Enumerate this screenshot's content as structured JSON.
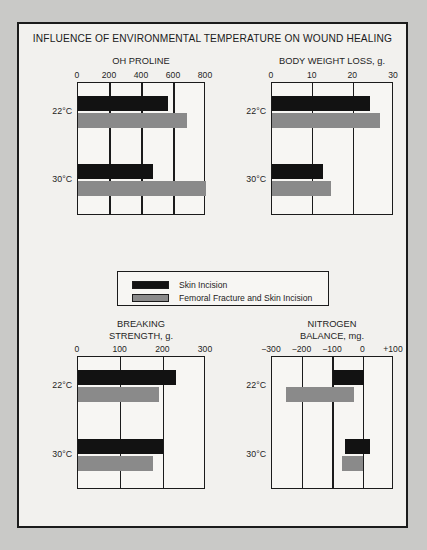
{
  "figure": {
    "title": "INFLUENCE OF ENVIRONMENTAL TEMPERATURE ON WOUND HEALING",
    "background_color": "#f2f1ee",
    "border_color": "#1b1b1b",
    "page_background": "#c9c9c7"
  },
  "legend": {
    "entries": [
      {
        "label": "Skin Incision",
        "color": "#121212",
        "key": "skin-incision"
      },
      {
        "label": "Femoral Fracture and Skin Incision",
        "color": "#8a8a8a",
        "key": "femoral-fracture-and-skin-incision"
      }
    ]
  },
  "chart_data": [
    {
      "id": "oh-proline",
      "type": "bar",
      "orientation": "horizontal",
      "title": "OH PROLINE",
      "title_lines": [
        "OH PROLINE"
      ],
      "xlabel": "",
      "ylabel": "",
      "categories": [
        "22°C",
        "30°C"
      ],
      "xlim": [
        0,
        800
      ],
      "ticks": [
        0,
        200,
        400,
        600,
        800
      ],
      "tick_labels": [
        "0",
        "200",
        "400",
        "600",
        "800"
      ],
      "grid": true,
      "series": [
        {
          "name": "Skin Incision",
          "color": "#121212",
          "values": [
            560,
            470
          ]
        },
        {
          "name": "Femoral Fracture and Skin Incision",
          "color": "#8a8a8a",
          "values": [
            680,
            800
          ]
        }
      ]
    },
    {
      "id": "body-weight-loss",
      "type": "bar",
      "orientation": "horizontal",
      "title": "BODY WEIGHT LOSS, g.",
      "title_lines": [
        "BODY WEIGHT LOSS, g."
      ],
      "xlabel": "",
      "ylabel": "",
      "categories": [
        "22°C",
        "30°C"
      ],
      "xlim": [
        0,
        30
      ],
      "ticks": [
        0,
        10,
        20,
        30
      ],
      "tick_labels": [
        "0",
        "10",
        "20",
        "30"
      ],
      "grid": true,
      "series": [
        {
          "name": "Skin Incision",
          "color": "#121212",
          "values": [
            24,
            12.5
          ]
        },
        {
          "name": "Femoral Fracture and Skin Incision",
          "color": "#8a8a8a",
          "values": [
            26.5,
            14.5
          ]
        }
      ]
    },
    {
      "id": "breaking-strength",
      "type": "bar",
      "orientation": "horizontal",
      "title": "BREAKING STRENGTH, g.",
      "title_lines": [
        "BREAKING",
        "STRENGTH, g."
      ],
      "xlabel": "",
      "ylabel": "",
      "categories": [
        "22°C",
        "30°C"
      ],
      "xlim": [
        0,
        300
      ],
      "ticks": [
        0,
        100,
        200,
        300
      ],
      "tick_labels": [
        "0",
        "100",
        "200",
        "300"
      ],
      "grid": true,
      "series": [
        {
          "name": "Skin Incision",
          "color": "#121212",
          "values": [
            230,
            200
          ]
        },
        {
          "name": "Femoral Fracture and Skin Incision",
          "color": "#8a8a8a",
          "values": [
            190,
            175
          ]
        }
      ]
    },
    {
      "id": "nitrogen-balance",
      "type": "bar",
      "orientation": "horizontal",
      "title": "NITROGEN BALANCE, mg.",
      "title_lines": [
        "NITROGEN",
        "BALANCE, mg."
      ],
      "xlabel": "",
      "ylabel": "",
      "categories": [
        "22°C",
        "30°C"
      ],
      "xlim": [
        -300,
        100
      ],
      "ticks": [
        -300,
        -200,
        -100,
        0,
        100
      ],
      "tick_labels": [
        "−300",
        "−200",
        "−100",
        "0",
        "+100"
      ],
      "grid": true,
      "note": "Bars are floating ranges spanning from start to end along the x axis.",
      "series": [
        {
          "name": "Skin Incision",
          "color": "#121212",
          "ranges": [
            {
              "start": -100,
              "end": 0
            },
            {
              "start": -60,
              "end": 20
            }
          ]
        },
        {
          "name": "Femoral Fracture and Skin Incision",
          "color": "#8a8a8a",
          "ranges": [
            {
              "start": -255,
              "end": -30
            },
            {
              "start": -70,
              "end": 0
            }
          ]
        }
      ]
    }
  ]
}
